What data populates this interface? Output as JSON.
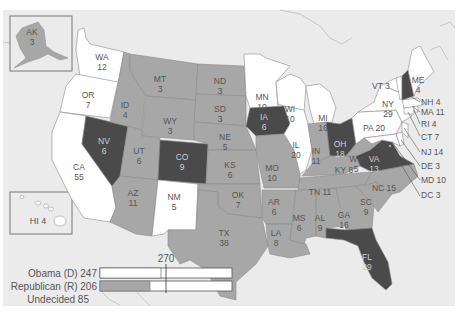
{
  "colors": {
    "background": "#ffffff",
    "map_background": "#ebebeb",
    "ocean_border": "#bdbdbd",
    "democrat_fill": "#ffffff",
    "republican_fill": "#a7a7a7",
    "undecided_fill": "#4a4a4a",
    "border": "#8a8a8a",
    "label_dark": "#555555",
    "label_light": "#cfcfcf"
  },
  "states": [
    {
      "abbr": "AK",
      "ev": "3",
      "status": "republican"
    },
    {
      "abbr": "HI",
      "ev": "4",
      "status": "democrat",
      "label": "HI 4"
    },
    {
      "abbr": "WA",
      "ev": "12",
      "status": "democrat"
    },
    {
      "abbr": "OR",
      "ev": "7",
      "status": "democrat"
    },
    {
      "abbr": "CA",
      "ev": "55",
      "status": "democrat"
    },
    {
      "abbr": "NV",
      "ev": "6",
      "status": "undecided"
    },
    {
      "abbr": "ID",
      "ev": "4",
      "status": "republican"
    },
    {
      "abbr": "MT",
      "ev": "3",
      "status": "republican"
    },
    {
      "abbr": "WY",
      "ev": "3",
      "status": "republican"
    },
    {
      "abbr": "UT",
      "ev": "6",
      "status": "republican"
    },
    {
      "abbr": "AZ",
      "ev": "11",
      "status": "republican"
    },
    {
      "abbr": "CO",
      "ev": "9",
      "status": "undecided"
    },
    {
      "abbr": "NM",
      "ev": "5",
      "status": "democrat"
    },
    {
      "abbr": "ND",
      "ev": "3",
      "status": "republican"
    },
    {
      "abbr": "SD",
      "ev": "3",
      "status": "republican"
    },
    {
      "abbr": "NE",
      "ev": "5",
      "status": "republican"
    },
    {
      "abbr": "KS",
      "ev": "6",
      "status": "republican"
    },
    {
      "abbr": "OK",
      "ev": "7",
      "status": "republican"
    },
    {
      "abbr": "TX",
      "ev": "38",
      "status": "republican"
    },
    {
      "abbr": "MN",
      "ev": "10",
      "status": "democrat"
    },
    {
      "abbr": "IA",
      "ev": "6",
      "status": "undecided"
    },
    {
      "abbr": "MO",
      "ev": "10",
      "status": "republican"
    },
    {
      "abbr": "AR",
      "ev": "6",
      "status": "republican"
    },
    {
      "abbr": "LA",
      "ev": "8",
      "status": "republican"
    },
    {
      "abbr": "WI",
      "ev": "10",
      "status": "democrat"
    },
    {
      "abbr": "IL",
      "ev": "20",
      "status": "democrat"
    },
    {
      "abbr": "MI",
      "ev": "16",
      "status": "democrat"
    },
    {
      "abbr": "IN",
      "ev": "11",
      "status": "republican"
    },
    {
      "abbr": "OH",
      "ev": "18",
      "status": "undecided"
    },
    {
      "abbr": "KY",
      "ev": "8",
      "status": "republican",
      "label": "KY 8"
    },
    {
      "abbr": "TN",
      "ev": "11",
      "status": "republican",
      "label": "TN 11"
    },
    {
      "abbr": "MS",
      "ev": "6",
      "status": "republican"
    },
    {
      "abbr": "AL",
      "ev": "9",
      "status": "republican"
    },
    {
      "abbr": "GA",
      "ev": "16",
      "status": "republican"
    },
    {
      "abbr": "FL",
      "ev": "29",
      "status": "undecided"
    },
    {
      "abbr": "SC",
      "ev": "9",
      "status": "republican"
    },
    {
      "abbr": "NC",
      "ev": "15",
      "status": "republican",
      "label": "NC 15"
    },
    {
      "abbr": "VA",
      "ev": "13",
      "status": "undecided"
    },
    {
      "abbr": "WV",
      "ev": "5",
      "status": "republican"
    },
    {
      "abbr": "PA",
      "ev": "20",
      "status": "democrat",
      "label": "PA 20"
    },
    {
      "abbr": "NY",
      "ev": "29",
      "status": "democrat"
    },
    {
      "abbr": "VT",
      "ev": "3",
      "status": "democrat",
      "label": "VT 3"
    },
    {
      "abbr": "NH",
      "ev": "4",
      "status": "undecided",
      "label": "NH 4"
    },
    {
      "abbr": "ME",
      "ev": "4",
      "status": "democrat"
    },
    {
      "abbr": "MA",
      "ev": "11",
      "status": "democrat",
      "label": "MA 11"
    },
    {
      "abbr": "RI",
      "ev": "4",
      "status": "democrat",
      "label": "RI 4"
    },
    {
      "abbr": "CT",
      "ev": "7",
      "status": "democrat",
      "label": "CT 7"
    },
    {
      "abbr": "NJ",
      "ev": "14",
      "status": "democrat",
      "label": "NJ 14"
    },
    {
      "abbr": "DE",
      "ev": "3",
      "status": "democrat",
      "label": "DE 3"
    },
    {
      "abbr": "MD",
      "ev": "10",
      "status": "democrat",
      "label": "MD 10"
    },
    {
      "abbr": "DC",
      "ev": "3",
      "status": "democrat",
      "label": "DC 3"
    }
  ],
  "labels": {
    "AK": {
      "name": "AK",
      "ev": "3"
    },
    "WA": {
      "name": "WA",
      "ev": "12"
    },
    "OR": {
      "name": "OR",
      "ev": "7"
    },
    "CA": {
      "name": "CA",
      "ev": "55"
    },
    "NV": {
      "name": "NV",
      "ev": "6"
    },
    "ID": {
      "name": "ID",
      "ev": "4"
    },
    "MT": {
      "name": "MT",
      "ev": "3"
    },
    "WY": {
      "name": "WY",
      "ev": "3"
    },
    "UT": {
      "name": "UT",
      "ev": "6"
    },
    "AZ": {
      "name": "AZ",
      "ev": "11"
    },
    "CO": {
      "name": "CO",
      "ev": "9"
    },
    "NM": {
      "name": "NM",
      "ev": "5"
    },
    "ND": {
      "name": "ND",
      "ev": "3"
    },
    "SD": {
      "name": "SD",
      "ev": "3"
    },
    "NE": {
      "name": "NE",
      "ev": "5"
    },
    "KS": {
      "name": "KS",
      "ev": "6"
    },
    "OK": {
      "name": "OK",
      "ev": "7"
    },
    "TX": {
      "name": "TX",
      "ev": "38"
    },
    "MN": {
      "name": "MN",
      "ev": "10"
    },
    "IA": {
      "name": "IA",
      "ev": "6"
    },
    "MO": {
      "name": "MO",
      "ev": "10"
    },
    "AR": {
      "name": "AR",
      "ev": "6"
    },
    "LA": {
      "name": "LA",
      "ev": "8"
    },
    "WI": {
      "name": "WI",
      "ev": "10"
    },
    "IL": {
      "name": "IL",
      "ev": "20"
    },
    "MI": {
      "name": "MI",
      "ev": "16"
    },
    "IN": {
      "name": "IN",
      "ev": "11"
    },
    "OH": {
      "name": "OH",
      "ev": "18"
    },
    "MS": {
      "name": "MS",
      "ev": "6"
    },
    "AL": {
      "name": "AL",
      "ev": "9"
    },
    "GA": {
      "name": "GA",
      "ev": "16"
    },
    "FL": {
      "name": "FL",
      "ev": "29"
    },
    "SC": {
      "name": "SC",
      "ev": "9"
    },
    "VA": {
      "name": "VA",
      "ev": "13"
    },
    "WV": {
      "name": "WV",
      "ev": "5"
    },
    "NY": {
      "name": "NY",
      "ev": "29"
    },
    "ME": {
      "name": "ME",
      "ev": "4"
    },
    "HI": "HI 4",
    "KY": "KY 8",
    "TN": "TN 11",
    "NC": "NC 15",
    "PA": "PA 20",
    "VT": "VT 3",
    "NH": "NH 4",
    "MA": "MA 11",
    "RI": "RI 4",
    "CT": "CT 7",
    "NJ": "NJ 14",
    "DE": "DE 3",
    "MD": "MD 10",
    "DC": "DC 3"
  },
  "legend": {
    "threshold_label": "270",
    "threshold_value": 270,
    "total_ev": 538,
    "rows": [
      {
        "label": "Obama (D) 247",
        "party": "Obama (D)",
        "value": 247,
        "fill": "#ffffff"
      },
      {
        "label": "Republican (R) 206",
        "party": "Republican (R)",
        "value": 206,
        "fill": "#a7a7a7"
      },
      {
        "label": "Undecided 85",
        "party": "Undecided",
        "value": 85
      }
    ]
  }
}
